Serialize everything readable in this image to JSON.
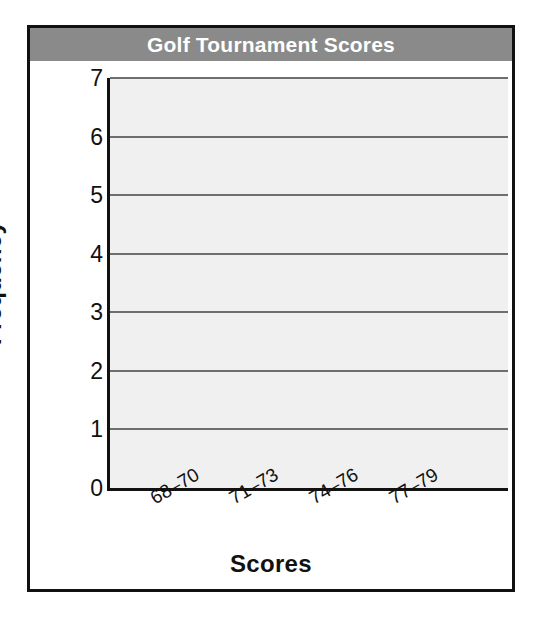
{
  "chart_data": {
    "type": "bar",
    "title": "Golf Tournament Scores",
    "xlabel": "Scores",
    "ylabel": "Frequency",
    "categories": [
      "68–70",
      "71–73",
      "74–76",
      "77–79"
    ],
    "values": [
      null,
      null,
      null,
      null
    ],
    "ylim": [
      0,
      7
    ],
    "yticks": [
      "7",
      "6",
      "5",
      "4",
      "3",
      "2",
      "1",
      "0"
    ],
    "grid": "horizontal",
    "legend": "none",
    "note": "blank histogram template — no bars plotted",
    "colors": {
      "title_band": "#8a8a8a",
      "title_text": "#ffffff",
      "plot_background": "#f0f0f0",
      "gridline": "#6e6e6e",
      "axis": "#111111",
      "frame": "#111111",
      "page_background": "#ffffff"
    }
  }
}
